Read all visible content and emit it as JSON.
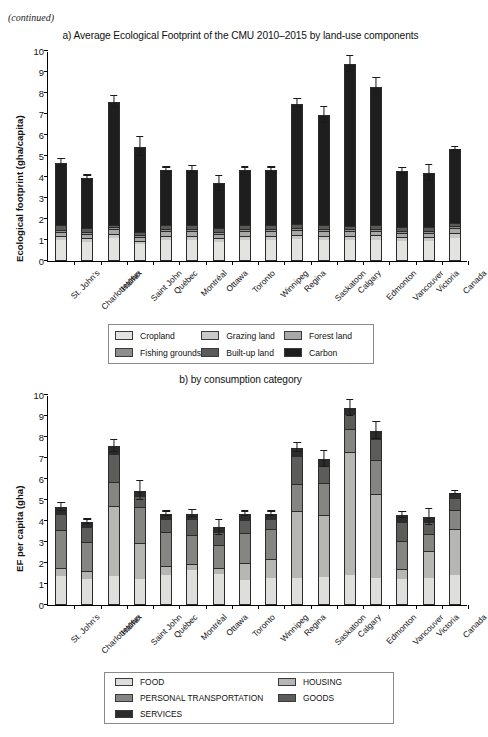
{
  "page": {
    "continued_note": "(continued)"
  },
  "chart_data": [
    {
      "id": "chart-a",
      "type": "bar",
      "stacked": true,
      "title": "a) Average Ecological Footprint of the CMU 2010–2015 by land-use components",
      "xlabel": "",
      "ylabel": "Ecological footprint (gha/capita)",
      "ylim": [
        0,
        10
      ],
      "yticks": [
        0,
        1,
        2,
        3,
        4,
        5,
        6,
        7,
        8,
        9,
        10
      ],
      "grid": false,
      "legend_position": "below",
      "categories": [
        "St. John's",
        "Charlottetown",
        "Halifax",
        "Saint John",
        "Québec",
        "Montréal",
        "Ottawa",
        "Toronto",
        "Winnipeg",
        "Regina",
        "Saskatoon",
        "Calgary",
        "Edmonton",
        "Vancouver",
        "Victoria",
        "Canada"
      ],
      "series": [
        {
          "name": "Cropland",
          "color": "#e3e3e1",
          "values": [
            0.98,
            0.9,
            1.08,
            0.8,
            1.0,
            1.0,
            0.92,
            1.0,
            1.0,
            1.05,
            1.0,
            1.0,
            1.02,
            0.95,
            0.95,
            1.1
          ]
        },
        {
          "name": "Grazing land",
          "color": "#c9c9c7",
          "values": [
            0.2,
            0.18,
            0.22,
            0.16,
            0.2,
            0.2,
            0.18,
            0.2,
            0.2,
            0.2,
            0.2,
            0.2,
            0.2,
            0.18,
            0.18,
            0.22
          ]
        },
        {
          "name": "Forest land",
          "color": "#a8a8a6",
          "values": [
            0.22,
            0.2,
            0.24,
            0.18,
            0.22,
            0.22,
            0.2,
            0.22,
            0.22,
            0.22,
            0.22,
            0.22,
            0.22,
            0.2,
            0.2,
            0.24
          ]
        },
        {
          "name": "Fishing grounds",
          "color": "#8e8e8c",
          "values": [
            0.1,
            0.09,
            0.1,
            0.08,
            0.1,
            0.1,
            0.09,
            0.1,
            0.1,
            0.1,
            0.1,
            0.1,
            0.1,
            0.09,
            0.09,
            0.1
          ]
        },
        {
          "name": "Built-up land",
          "color": "#5a5a58",
          "values": [
            0.22,
            0.2,
            0.1,
            0.18,
            0.22,
            0.2,
            0.2,
            0.2,
            0.2,
            0.2,
            0.2,
            0.15,
            0.18,
            0.2,
            0.2,
            0.16
          ]
        },
        {
          "name": "Carbon",
          "color": "#1e1e1e",
          "values": [
            2.95,
            2.4,
            5.82,
            4.05,
            2.61,
            2.63,
            2.11,
            2.63,
            2.63,
            5.73,
            5.23,
            7.73,
            6.58,
            2.68,
            2.58,
            3.53
          ]
        }
      ],
      "totals": [
        4.67,
        3.97,
        7.56,
        5.45,
        4.35,
        4.35,
        3.7,
        4.35,
        4.35,
        7.5,
        6.95,
        9.4,
        8.3,
        4.3,
        4.2,
        5.35
      ],
      "errors": [
        0.18,
        0.1,
        0.28,
        0.45,
        0.1,
        0.17,
        0.35,
        0.1,
        0.1,
        0.2,
        0.4,
        0.38,
        0.4,
        0.14,
        0.38,
        0.06
      ]
    },
    {
      "id": "chart-b",
      "type": "bar",
      "stacked": true,
      "title": "b) by consumption category",
      "xlabel": "",
      "ylabel": "EF per capita (gha)",
      "ylim": [
        0,
        10
      ],
      "yticks": [
        0,
        1,
        2,
        3,
        4,
        5,
        6,
        7,
        8,
        9,
        10
      ],
      "grid": false,
      "legend_position": "below",
      "categories": [
        "St. John's",
        "Charlottetown",
        "Halifax",
        "Saint John",
        "Québec",
        "Montréal",
        "Ottawa",
        "Toronto",
        "Winnipeg",
        "Regina",
        "Saskatoon",
        "Calgary",
        "Edmonton",
        "Vancouver",
        "Victoria",
        "Canada"
      ],
      "series": [
        {
          "name": "FOOD",
          "color": "#dededc",
          "values": [
            1.38,
            1.22,
            1.38,
            1.22,
            1.42,
            1.65,
            1.48,
            1.2,
            1.28,
            1.3,
            1.35,
            1.45,
            1.3,
            1.25,
            1.28,
            1.42
          ]
        },
        {
          "name": "HOUSING",
          "color": "#b6b6b4",
          "values": [
            0.4,
            0.42,
            3.32,
            1.72,
            0.46,
            0.28,
            0.28,
            0.82,
            0.9,
            3.18,
            2.95,
            5.85,
            3.98,
            0.45,
            1.28,
            2.2
          ]
        },
        {
          "name": "PERSONAL TRANSPORTATION",
          "color": "#858583",
          "values": [
            1.78,
            1.38,
            1.18,
            1.72,
            1.58,
            1.42,
            1.12,
            1.4,
            1.42,
            1.3,
            1.5,
            1.1,
            1.62,
            1.35,
            0.8,
            0.9
          ]
        },
        {
          "name": "GOODS",
          "color": "#5c5c5a",
          "values": [
            0.78,
            0.68,
            1.3,
            0.55,
            0.62,
            0.74,
            0.58,
            0.65,
            0.5,
            1.3,
            0.82,
            0.68,
            1.0,
            0.9,
            0.6,
            0.6
          ]
        },
        {
          "name": "SERVICES",
          "color": "#2b2b2b",
          "values": [
            0.33,
            0.27,
            0.38,
            0.24,
            0.27,
            0.26,
            0.24,
            0.28,
            0.25,
            0.42,
            0.33,
            0.32,
            0.4,
            0.35,
            0.24,
            0.23
          ]
        }
      ],
      "totals": [
        4.67,
        3.97,
        7.56,
        5.45,
        4.35,
        4.35,
        3.7,
        4.35,
        4.35,
        7.5,
        6.95,
        9.4,
        8.3,
        4.3,
        4.2,
        5.35
      ],
      "errors": [
        0.18,
        0.1,
        0.28,
        0.45,
        0.1,
        0.17,
        0.35,
        0.1,
        0.1,
        0.2,
        0.4,
        0.38,
        0.4,
        0.14,
        0.38,
        0.06
      ]
    }
  ],
  "legend_a": {
    "items": [
      {
        "label": "Cropland",
        "color": "#e3e3e1"
      },
      {
        "label": "Grazing land",
        "color": "#c9c9c7"
      },
      {
        "label": "Forest land",
        "color": "#a8a8a6"
      },
      {
        "label": "Fishing grounds",
        "color": "#8e8e8c"
      },
      {
        "label": "Built-up land",
        "color": "#5a5a58"
      },
      {
        "label": "Carbon",
        "color": "#1e1e1e"
      }
    ]
  },
  "legend_b": {
    "items": [
      {
        "label": "FOOD",
        "color": "#dededc"
      },
      {
        "label": "HOUSING",
        "color": "#b6b6b4"
      },
      {
        "label": "PERSONAL TRANSPORTATION",
        "color": "#858583"
      },
      {
        "label": "GOODS",
        "color": "#5c5c5a"
      },
      {
        "label": "SERVICES",
        "color": "#2b2b2b"
      }
    ]
  }
}
